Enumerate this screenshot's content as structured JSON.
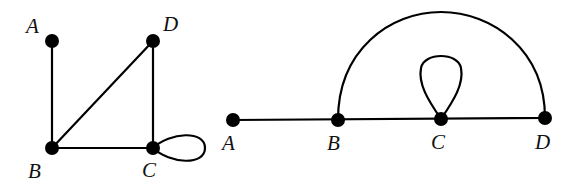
{
  "graphs": [
    {
      "id": "left",
      "nodes": [
        {
          "name": "A",
          "x": 52,
          "y": 41,
          "lx": 26,
          "ly": 33
        },
        {
          "name": "D",
          "x": 153,
          "y": 41,
          "lx": 163,
          "ly": 31
        },
        {
          "name": "B",
          "x": 52,
          "y": 148,
          "lx": 28,
          "ly": 178
        },
        {
          "name": "C",
          "x": 153,
          "y": 148,
          "lx": 142,
          "ly": 177
        }
      ],
      "edges": [
        [
          "A",
          "B"
        ],
        [
          "B",
          "D"
        ],
        [
          "D",
          "C"
        ],
        [
          "B",
          "C"
        ]
      ],
      "loops": [
        {
          "node": "C",
          "direction": "right"
        }
      ]
    },
    {
      "id": "right",
      "nodes": [
        {
          "name": "A",
          "x": 233,
          "y": 120,
          "lx": 222,
          "ly": 150
        },
        {
          "name": "B",
          "x": 338,
          "y": 120,
          "lx": 327,
          "ly": 150
        },
        {
          "name": "C",
          "x": 441,
          "y": 119,
          "lx": 431,
          "ly": 149
        },
        {
          "name": "D",
          "x": 545,
          "y": 118,
          "lx": 535,
          "ly": 149
        }
      ],
      "edges": [
        [
          "A",
          "B"
        ],
        [
          "B",
          "C"
        ],
        [
          "C",
          "D"
        ]
      ],
      "arcs": [
        {
          "from": "B",
          "to": "D",
          "top_y": 12
        }
      ],
      "loops": [
        {
          "node": "C",
          "direction": "up"
        }
      ]
    }
  ],
  "labels": {
    "left": {
      "A": "A",
      "B": "B",
      "C": "C",
      "D": "D"
    },
    "right": {
      "A": "A",
      "B": "B",
      "C": "C",
      "D": "D"
    }
  }
}
